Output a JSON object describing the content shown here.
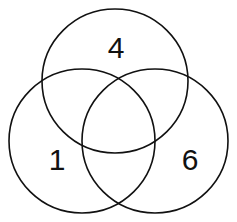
{
  "diagram": {
    "type": "venn",
    "sets": [
      {
        "id": "top",
        "label": "4",
        "cx": 115,
        "cy": 81,
        "rx": 73,
        "ry": 72,
        "label_x": 116,
        "label_y": 58
      },
      {
        "id": "left",
        "label": "1",
        "cx": 82,
        "cy": 141,
        "rx": 73,
        "ry": 72,
        "label_x": 57,
        "label_y": 170
      },
      {
        "id": "right",
        "label": "6",
        "cx": 155,
        "cy": 141,
        "rx": 73,
        "ry": 72,
        "label_x": 190,
        "label_y": 170
      }
    ],
    "stroke_color": "#111111",
    "background": "#ffffff"
  }
}
